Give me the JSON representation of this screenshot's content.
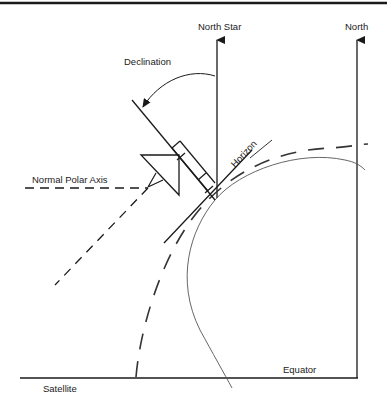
{
  "diagram": {
    "type": "satellite-dish polar mount geometry",
    "labels": {
      "north_star": "North Star",
      "north": "North",
      "declination": "Declination",
      "horizon": "Horizon",
      "normal_polar_axis": "Normal Polar Axis",
      "satellite": "Satellite",
      "equator": "Equator"
    },
    "colors": {
      "line": "#1a1a1a",
      "curve": "#444444",
      "background": "#ffffff"
    }
  }
}
